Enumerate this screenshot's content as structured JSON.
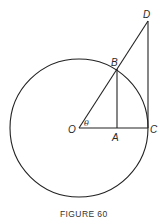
{
  "figure": {
    "caption": "FIGURE 60",
    "points": {
      "O": "O",
      "A": "A",
      "B": "B",
      "C": "C",
      "D": "D"
    },
    "angle_label": "θ"
  }
}
